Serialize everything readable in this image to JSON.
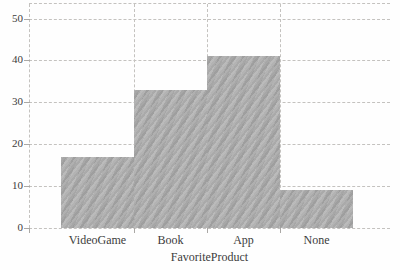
{
  "chart_data": {
    "type": "bar",
    "style": "histogram-touching-bars",
    "title": "",
    "categories": [
      "VideoGame",
      "Book",
      "App",
      "None"
    ],
    "values": [
      17,
      33,
      41,
      9
    ],
    "xlabel": "FavoriteProduct",
    "ylabel": "",
    "ylim": [
      0,
      50
    ],
    "yticks": [
      0,
      10,
      20,
      30,
      40,
      50
    ],
    "grid": "dashed horizontal gridlines at each y tick, dashed vertical lines at interior bar boundaries, dashed top frame and dashed y-axis",
    "legend": "none",
    "bar_color": "#aeaeae",
    "bar_texture": "subtle diagonal gray waves",
    "grid_color": "#c4c2bf",
    "tick_color": "#aaa8a5",
    "text_color": "#3c3c3c",
    "background": "#fefefe"
  }
}
